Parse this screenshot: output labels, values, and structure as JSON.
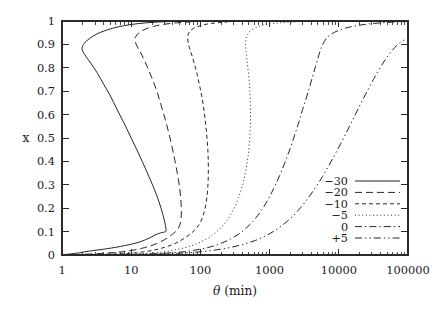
{
  "chart_data": {
    "type": "line",
    "title": "",
    "xlabel": "θ (min)",
    "xlabel_symbol": "θ",
    "xlabel_unit": "(min)",
    "ylabel": "x",
    "xscale": "log",
    "yscale": "linear",
    "xlim": [
      1,
      100000
    ],
    "ylim": [
      0,
      1
    ],
    "grid": false,
    "legend_position": "lower-right-inside",
    "xtick_labels": [
      "1",
      "10",
      "100",
      "1000",
      "10000",
      "100000"
    ],
    "xtick_values": [
      1,
      10,
      100,
      1000,
      10000,
      100000
    ],
    "ytick_labels": [
      "0",
      "0.1",
      "0.2",
      "0.3",
      "0.4",
      "0.5",
      "0.6",
      "0.7",
      "0.8",
      "0.9",
      "1"
    ],
    "ytick_values": [
      0,
      0.1,
      0.2,
      0.3,
      0.4,
      0.5,
      0.6,
      0.7,
      0.8,
      0.9,
      1
    ],
    "series": [
      {
        "name": "−30",
        "dash": "none",
        "points": [
          [
            1.05,
            0.002
          ],
          [
            1.3,
            0.004
          ],
          [
            1.8,
            0.01
          ],
          [
            2.4,
            0.016
          ],
          [
            3.2,
            0.021
          ],
          [
            4.5,
            0.027
          ],
          [
            6.0,
            0.033
          ],
          [
            8.0,
            0.04
          ],
          [
            10.0,
            0.046
          ],
          [
            13.0,
            0.055
          ],
          [
            16.0,
            0.065
          ],
          [
            19.0,
            0.075
          ],
          [
            22.0,
            0.085
          ],
          [
            25.0,
            0.092
          ],
          [
            28.0,
            0.096
          ],
          [
            30.0,
            0.098
          ],
          [
            31.5,
            0.1
          ],
          [
            32.0,
            0.105
          ],
          [
            31.5,
            0.12
          ],
          [
            30.0,
            0.15
          ],
          [
            27.0,
            0.2
          ],
          [
            23.0,
            0.26
          ],
          [
            19.0,
            0.32
          ],
          [
            15.5,
            0.38
          ],
          [
            12.5,
            0.44
          ],
          [
            10.0,
            0.5
          ],
          [
            8.0,
            0.56
          ],
          [
            6.3,
            0.62
          ],
          [
            5.0,
            0.68
          ],
          [
            4.0,
            0.73
          ],
          [
            3.2,
            0.78
          ],
          [
            2.6,
            0.82
          ],
          [
            2.2,
            0.85
          ],
          [
            2.0,
            0.87
          ],
          [
            1.95,
            0.885
          ],
          [
            2.1,
            0.905
          ],
          [
            2.5,
            0.925
          ],
          [
            3.2,
            0.945
          ],
          [
            4.5,
            0.962
          ],
          [
            6.5,
            0.975
          ],
          [
            10.0,
            0.985
          ],
          [
            16.0,
            0.992
          ],
          [
            25.0,
            0.996
          ],
          [
            40.0,
            0.998
          ],
          [
            70.0,
            0.9995
          ],
          [
            100000,
            1.0
          ]
        ]
      },
      {
        "name": "−20",
        "dash": "long-dash",
        "points": [
          [
            1.05,
            0.001
          ],
          [
            2.0,
            0.003
          ],
          [
            4.0,
            0.007
          ],
          [
            7.0,
            0.013
          ],
          [
            10.0,
            0.019
          ],
          [
            14.0,
            0.028
          ],
          [
            18.0,
            0.037
          ],
          [
            23.0,
            0.048
          ],
          [
            28.0,
            0.06
          ],
          [
            33.0,
            0.072
          ],
          [
            38.0,
            0.085
          ],
          [
            43.0,
            0.098
          ],
          [
            47.0,
            0.11
          ],
          [
            50.0,
            0.125
          ],
          [
            52.0,
            0.145
          ],
          [
            53.0,
            0.17
          ],
          [
            53.0,
            0.2
          ],
          [
            52.0,
            0.24
          ],
          [
            50.0,
            0.29
          ],
          [
            47.0,
            0.34
          ],
          [
            43.0,
            0.4
          ],
          [
            39.0,
            0.46
          ],
          [
            35.0,
            0.52
          ],
          [
            31.0,
            0.58
          ],
          [
            27.0,
            0.64
          ],
          [
            23.5,
            0.7
          ],
          [
            20.0,
            0.755
          ],
          [
            17.0,
            0.805
          ],
          [
            14.5,
            0.85
          ],
          [
            12.5,
            0.885
          ],
          [
            11.5,
            0.91
          ],
          [
            11.5,
            0.93
          ],
          [
            13.0,
            0.95
          ],
          [
            16.0,
            0.965
          ],
          [
            21.0,
            0.977
          ],
          [
            30.0,
            0.986
          ],
          [
            45.0,
            0.992
          ],
          [
            70.0,
            0.996
          ],
          [
            120.0,
            0.999
          ],
          [
            100000,
            1.0
          ]
        ]
      },
      {
        "name": "−10",
        "dash": "dash",
        "points": [
          [
            1.05,
            0.0008
          ],
          [
            3.0,
            0.002
          ],
          [
            7.0,
            0.005
          ],
          [
            12.0,
            0.01
          ],
          [
            18.0,
            0.017
          ],
          [
            25.0,
            0.026
          ],
          [
            33.0,
            0.036
          ],
          [
            42.0,
            0.048
          ],
          [
            52.0,
            0.062
          ],
          [
            63.0,
            0.078
          ],
          [
            75.0,
            0.095
          ],
          [
            88.0,
            0.115
          ],
          [
            100.0,
            0.14
          ],
          [
            110.0,
            0.17
          ],
          [
            118.0,
            0.205
          ],
          [
            124.0,
            0.245
          ],
          [
            128.0,
            0.29
          ],
          [
            130.0,
            0.34
          ],
          [
            130.0,
            0.395
          ],
          [
            128.0,
            0.45
          ],
          [
            124.0,
            0.505
          ],
          [
            119.0,
            0.56
          ],
          [
            113.0,
            0.615
          ],
          [
            106.0,
            0.67
          ],
          [
            98.0,
            0.72
          ],
          [
            90.0,
            0.77
          ],
          [
            82.0,
            0.815
          ],
          [
            75.0,
            0.855
          ],
          [
            69.0,
            0.888
          ],
          [
            66.0,
            0.915
          ],
          [
            66.0,
            0.938
          ],
          [
            70.0,
            0.955
          ],
          [
            80.0,
            0.969
          ],
          [
            98.0,
            0.979
          ],
          [
            125.0,
            0.987
          ],
          [
            170.0,
            0.992
          ],
          [
            240.0,
            0.996
          ],
          [
            350.0,
            0.998
          ],
          [
            100000,
            1.0
          ]
        ]
      },
      {
        "name": "−5",
        "dash": "dot",
        "points": [
          [
            1.05,
            0.0005
          ],
          [
            5.0,
            0.002
          ],
          [
            12.0,
            0.005
          ],
          [
            22.0,
            0.01
          ],
          [
            35.0,
            0.017
          ],
          [
            50.0,
            0.026
          ],
          [
            70.0,
            0.037
          ],
          [
            95.0,
            0.052
          ],
          [
            125.0,
            0.07
          ],
          [
            160.0,
            0.092
          ],
          [
            200.0,
            0.118
          ],
          [
            245.0,
            0.15
          ],
          [
            290.0,
            0.185
          ],
          [
            335.0,
            0.225
          ],
          [
            380.0,
            0.27
          ],
          [
            420.0,
            0.315
          ],
          [
            455.0,
            0.365
          ],
          [
            485.0,
            0.415
          ],
          [
            505.0,
            0.465
          ],
          [
            520.0,
            0.515
          ],
          [
            528.0,
            0.565
          ],
          [
            530.0,
            0.615
          ],
          [
            526.0,
            0.665
          ],
          [
            516.0,
            0.712
          ],
          [
            502.0,
            0.757
          ],
          [
            485.0,
            0.8
          ],
          [
            468.0,
            0.838
          ],
          [
            455.0,
            0.872
          ],
          [
            450.0,
            0.9
          ],
          [
            458.0,
            0.924
          ],
          [
            485.0,
            0.944
          ],
          [
            540.0,
            0.96
          ],
          [
            640.0,
            0.972
          ],
          [
            800.0,
            0.982
          ],
          [
            1100.0,
            0.989
          ],
          [
            1600.0,
            0.994
          ],
          [
            2600.0,
            0.997
          ],
          [
            5000.0,
            0.999
          ],
          [
            100000,
            1.0
          ]
        ]
      },
      {
        "name": "0",
        "dash": "dash-dot",
        "points": [
          [
            1.05,
            0.0004
          ],
          [
            8.0,
            0.002
          ],
          [
            20.0,
            0.005
          ],
          [
            40.0,
            0.01
          ],
          [
            65.0,
            0.016
          ],
          [
            100.0,
            0.025
          ],
          [
            145.0,
            0.036
          ],
          [
            200.0,
            0.05
          ],
          [
            270.0,
            0.068
          ],
          [
            360.0,
            0.09
          ],
          [
            470.0,
            0.118
          ],
          [
            600.0,
            0.15
          ],
          [
            760.0,
            0.19
          ],
          [
            940.0,
            0.235
          ],
          [
            1150.0,
            0.285
          ],
          [
            1400.0,
            0.34
          ],
          [
            1680.0,
            0.398
          ],
          [
            1980.0,
            0.455
          ],
          [
            2300.0,
            0.512
          ],
          [
            2650.0,
            0.568
          ],
          [
            3000.0,
            0.622
          ],
          [
            3400.0,
            0.672
          ],
          [
            3800.0,
            0.72
          ],
          [
            4200.0,
            0.765
          ],
          [
            4600.0,
            0.805
          ],
          [
            5000.0,
            0.842
          ],
          [
            5400.0,
            0.874
          ],
          [
            5900.0,
            0.901
          ],
          [
            6600.0,
            0.925
          ],
          [
            7800.0,
            0.944
          ],
          [
            9800.0,
            0.959
          ],
          [
            13000.0,
            0.971
          ],
          [
            18000.0,
            0.98
          ],
          [
            26000.0,
            0.987
          ],
          [
            40000.0,
            0.992
          ],
          [
            65000.0,
            0.996
          ],
          [
            100000,
            0.998
          ]
        ]
      },
      {
        "name": "+5",
        "dash": "dash-dot-dot",
        "points": [
          [
            1.05,
            0.0003
          ],
          [
            12.0,
            0.002
          ],
          [
            30.0,
            0.005
          ],
          [
            60.0,
            0.009
          ],
          [
            110.0,
            0.015
          ],
          [
            180.0,
            0.023
          ],
          [
            280.0,
            0.033
          ],
          [
            420.0,
            0.046
          ],
          [
            620.0,
            0.062
          ],
          [
            880.0,
            0.082
          ],
          [
            1200.0,
            0.105
          ],
          [
            1620.0,
            0.133
          ],
          [
            2150.0,
            0.165
          ],
          [
            2800.0,
            0.202
          ],
          [
            3600.0,
            0.243
          ],
          [
            4600.0,
            0.288
          ],
          [
            5800.0,
            0.335
          ],
          [
            7200.0,
            0.383
          ],
          [
            8900.0,
            0.432
          ],
          [
            10900.0,
            0.482
          ],
          [
            13200.0,
            0.53
          ],
          [
            15900.0,
            0.578
          ],
          [
            19000.0,
            0.624
          ],
          [
            22600.0,
            0.668
          ],
          [
            26800.0,
            0.71
          ],
          [
            31600.0,
            0.75
          ],
          [
            37200.0,
            0.787
          ],
          [
            43600.0,
            0.82
          ],
          [
            51000.0,
            0.85
          ],
          [
            59500.0,
            0.876
          ],
          [
            69500.0,
            0.897
          ],
          [
            81000.0,
            0.912
          ],
          [
            100000,
            0.93
          ]
        ]
      }
    ],
    "legend_entries": [
      {
        "label": "−30",
        "dash": "none"
      },
      {
        "label": "−20",
        "dash": "long-dash"
      },
      {
        "label": "−10",
        "dash": "dash"
      },
      {
        "label": "−5",
        "dash": "dot"
      },
      {
        "label": "0",
        "dash": "dash-dot"
      },
      {
        "label": "+5",
        "dash": "dash-dot-dot"
      }
    ]
  }
}
